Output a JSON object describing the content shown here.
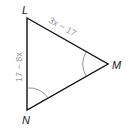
{
  "diagram": {
    "type": "triangle",
    "vertices": [
      {
        "id": "L",
        "label": "L",
        "x": 27,
        "y": 18
      },
      {
        "id": "M",
        "label": "M",
        "x": 108,
        "y": 64
      },
      {
        "id": "N",
        "label": "N",
        "x": 27,
        "y": 110
      }
    ],
    "sides": [
      {
        "from": "L",
        "to": "M",
        "label": "3x − 17"
      },
      {
        "from": "L",
        "to": "N",
        "label": "17 − 8x"
      }
    ],
    "congruent_angles": [
      "M",
      "N"
    ],
    "colors": {
      "stroke": "#111111",
      "arc": "#8a8a8a",
      "side_label": "#9a9a9a"
    }
  }
}
